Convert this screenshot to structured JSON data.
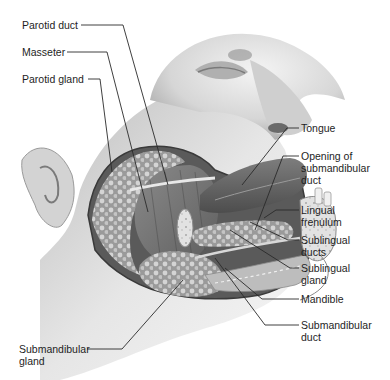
{
  "diagram": {
    "style": "grayscale anatomical illustration",
    "colors": {
      "background": "#ffffff",
      "label_text": "#1e1e1e",
      "leader_line": "#2a2a2a",
      "skin": "#d9d9d9",
      "gland_tissue": "#a9a9a9"
    },
    "labels_left": [
      {
        "id": "parotid-duct",
        "text": "Parotid duct"
      },
      {
        "id": "masseter",
        "text": "Masseter"
      },
      {
        "id": "parotid-gland",
        "text": "Parotid gland"
      },
      {
        "id": "submandibular-gland",
        "line1": "Submandibular",
        "line2": "gland"
      }
    ],
    "labels_right": [
      {
        "id": "tongue",
        "text": "Tongue"
      },
      {
        "id": "opening-submandibular-duct",
        "line1": "Opening of",
        "line2": "submandibular",
        "line3": "duct"
      },
      {
        "id": "lingual-frenulum",
        "line1": "Lingual",
        "line2": "frenulum"
      },
      {
        "id": "sublingual-ducts",
        "line1": "Sublingual",
        "line2": "ducts"
      },
      {
        "id": "sublingual-gland",
        "line1": "Sublingual",
        "line2": "gland"
      },
      {
        "id": "mandible",
        "text": "Mandible"
      },
      {
        "id": "submandibular-duct",
        "line1": "Submandibular",
        "line2": "duct"
      }
    ]
  }
}
